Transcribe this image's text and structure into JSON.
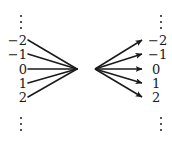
{
  "diagram": {
    "type": "integer-bijection-fan",
    "left_column": {
      "top_ellipsis": "⋮",
      "labels": [
        "−2",
        "−1",
        "0",
        "1",
        "2"
      ],
      "bottom_ellipsis": "⋮"
    },
    "right_column": {
      "top_ellipsis": "⋮",
      "labels": [
        "−2",
        "−1",
        "0",
        "1",
        "2"
      ],
      "bottom_ellipsis": "⋮"
    },
    "line_color": "#1a1a1a",
    "text_color": "#1a1a1a",
    "background_color": "#ffffff",
    "left_fan": {
      "description": "five line segments from the left integer labels converging to a single point",
      "converge_x": 77,
      "converge_y": 69,
      "start_x": 28,
      "start_ys": [
        40,
        54,
        69,
        83,
        97
      ]
    },
    "right_fan": {
      "description": "five arrows diverging from a single point to the right integer labels",
      "origin_x": 95,
      "origin_y": 69,
      "end_x": 144,
      "end_ys": [
        40,
        54,
        69,
        83,
        97
      ],
      "arrowheads": true
    }
  }
}
